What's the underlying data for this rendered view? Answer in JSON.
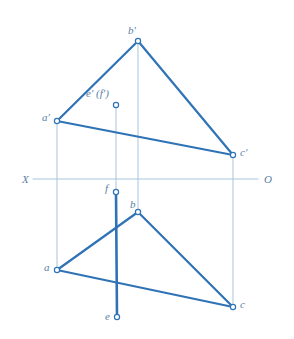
{
  "figure": {
    "colors": {
      "edge": "#2f73b6",
      "thick_edge": "#2f73b6",
      "projector": "#a9c4de",
      "axis": "#a9c4de",
      "marker_stroke": "#2f73b6",
      "marker_fill": "#ffffff",
      "label_text": "#5a7fa8",
      "background": "#ffffff"
    },
    "axis": {
      "left_label": "X",
      "right_label": "O",
      "y": 179,
      "x_start": 33,
      "x_end": 258,
      "left_label_x": 22,
      "left_label_y": 174,
      "right_label_x": 264,
      "right_label_y": 174
    },
    "points": [
      {
        "id": "b-prime",
        "label": "b′",
        "x": 138,
        "y": 41,
        "label_x": 128,
        "label_y": 25,
        "marker": "circle",
        "view": "frontal"
      },
      {
        "id": "a-prime",
        "label": "a′",
        "x": 57,
        "y": 121,
        "label_x": 42,
        "label_y": 112,
        "marker": "circle",
        "view": "frontal"
      },
      {
        "id": "c-prime",
        "label": "c′",
        "x": 233,
        "y": 155,
        "label_x": 240,
        "label_y": 147,
        "marker": "circle",
        "view": "frontal"
      },
      {
        "id": "ef-prime",
        "label": "e′ (f′)",
        "x": 116,
        "y": 105,
        "label_x": 86,
        "label_y": 88,
        "marker": "circle",
        "view": "frontal"
      },
      {
        "id": "b",
        "label": "b",
        "x": 138,
        "y": 212,
        "label_x": 130,
        "label_y": 199,
        "marker": "circle",
        "view": "horizontal"
      },
      {
        "id": "a",
        "label": "a",
        "x": 57,
        "y": 270,
        "label_x": 44,
        "label_y": 262,
        "marker": "circle",
        "view": "horizontal"
      },
      {
        "id": "c",
        "label": "c",
        "x": 233,
        "y": 307,
        "label_x": 240,
        "label_y": 299,
        "marker": "circle",
        "view": "horizontal"
      },
      {
        "id": "f",
        "label": "f",
        "x": 116,
        "y": 192,
        "label_x": 105,
        "label_y": 183,
        "marker": "circle",
        "view": "horizontal"
      },
      {
        "id": "e",
        "label": "e",
        "x": 117,
        "y": 317,
        "label_x": 105,
        "label_y": 311,
        "marker": "circle",
        "view": "horizontal"
      }
    ],
    "edges": [
      {
        "id": "edge-ab-prime",
        "from": "a-prime",
        "to": "b-prime",
        "x1": 57,
        "y1": 121,
        "x2": 138,
        "y2": 41,
        "width": 2.2,
        "style": "solid",
        "kind": "edge"
      },
      {
        "id": "edge-bc-prime",
        "from": "b-prime",
        "to": "c-prime",
        "x1": 138,
        "y1": 41,
        "x2": 233,
        "y2": 155,
        "width": 2.2,
        "style": "solid",
        "kind": "edge"
      },
      {
        "id": "edge-ac-prime",
        "from": "a-prime",
        "to": "c-prime",
        "x1": 57,
        "y1": 121,
        "x2": 233,
        "y2": 155,
        "width": 2.2,
        "style": "solid",
        "kind": "edge"
      },
      {
        "id": "edge-ab",
        "from": "a",
        "to": "b",
        "x1": 57,
        "y1": 270,
        "x2": 138,
        "y2": 212,
        "width": 2.2,
        "style": "solid",
        "kind": "edge"
      },
      {
        "id": "edge-bc",
        "from": "b",
        "to": "c",
        "x1": 138,
        "y1": 212,
        "x2": 233,
        "y2": 307,
        "width": 2.2,
        "style": "solid",
        "kind": "edge"
      },
      {
        "id": "edge-ac",
        "from": "a",
        "to": "c",
        "x1": 57,
        "y1": 270,
        "x2": 233,
        "y2": 307,
        "width": 2.2,
        "style": "solid",
        "kind": "edge"
      },
      {
        "id": "segment-fe",
        "from": "f",
        "to": "e",
        "x1": 116,
        "y1": 192,
        "x2": 117,
        "y2": 317,
        "width": 2.6,
        "style": "solid",
        "kind": "thick-edge"
      }
    ],
    "projectors": [
      {
        "id": "projector-a",
        "x1": 57,
        "y1": 121,
        "x2": 57,
        "y2": 270,
        "width": 1
      },
      {
        "id": "projector-b",
        "x1": 138,
        "y1": 41,
        "x2": 138,
        "y2": 212,
        "width": 1
      },
      {
        "id": "projector-c",
        "x1": 233,
        "y1": 155,
        "x2": 233,
        "y2": 307,
        "width": 1
      },
      {
        "id": "projector-ef",
        "x1": 116,
        "y1": 105,
        "x2": 116,
        "y2": 192,
        "width": 1
      }
    ],
    "marker_radius": 2.6
  }
}
